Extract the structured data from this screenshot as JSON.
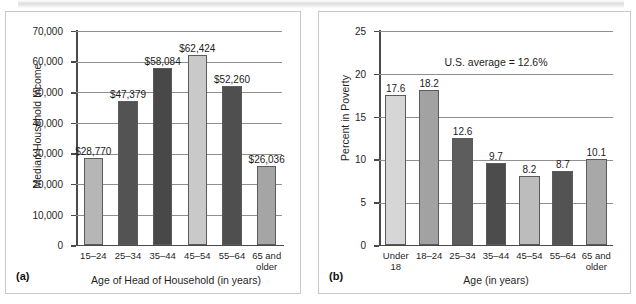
{
  "figure": {
    "panels": [
      "a",
      "b"
    ]
  },
  "chart_data": [
    {
      "type": "bar",
      "tag": "(a)",
      "title": "",
      "xlabel": "Age of Head of Household (in years)",
      "ylabel": "Median Household Income",
      "categories": [
        "15–24",
        "25–34",
        "35–44",
        "45–54",
        "55–64",
        "65 and older"
      ],
      "values": [
        28770,
        47379,
        58084,
        62424,
        52260,
        26036
      ],
      "data_labels": [
        "$28,770",
        "$47,379",
        "$58,084",
        "$62,424",
        "$52,260",
        "$26,036"
      ],
      "bar_colors": [
        "#b6b6b6",
        "#535353",
        "#484848",
        "#c9c9c9",
        "#4f4f4f",
        "#a5a5a5"
      ],
      "ylim": [
        0,
        70000
      ],
      "yticks": [
        0,
        10000,
        20000,
        30000,
        40000,
        50000,
        60000,
        70000
      ],
      "ytick_labels": [
        "0",
        "10,000",
        "20,000",
        "30,000",
        "40,000",
        "50,000",
        "60,000",
        "70,000"
      ],
      "grid": true,
      "legend": false,
      "annotations": []
    },
    {
      "type": "bar",
      "tag": "(b)",
      "title": "",
      "xlabel": "Age (in years)",
      "ylabel": "Percent in Poverty",
      "categories": [
        "Under 18",
        "18–24",
        "25–34",
        "35–44",
        "45–54",
        "55–64",
        "65 and older"
      ],
      "values": [
        17.6,
        18.2,
        12.6,
        9.7,
        8.2,
        8.7,
        10.1
      ],
      "data_labels": [
        "17.6",
        "18.2",
        "12.6",
        "9.7",
        "8.2",
        "8.7",
        "10.1"
      ],
      "bar_colors": [
        "#d6d6d6",
        "#a2a2a2",
        "#5d5d5d",
        "#4c4c4c",
        "#bcbcbc",
        "#535353",
        "#a8a8a8"
      ],
      "ylim": [
        0,
        25
      ],
      "yticks": [
        0,
        5,
        10,
        15,
        20,
        25
      ],
      "ytick_labels": [
        "0",
        "5",
        "10",
        "15",
        "20",
        "25"
      ],
      "grid": true,
      "legend": false,
      "annotations": [
        "U.S. average = 12.6%"
      ]
    }
  ]
}
